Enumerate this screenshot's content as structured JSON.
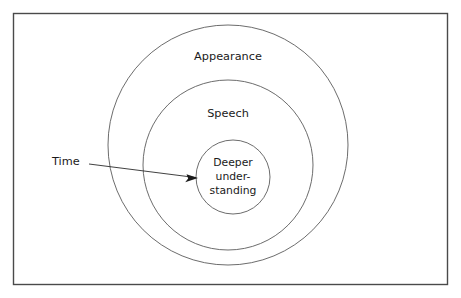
{
  "diagram": {
    "type": "concentric-circles",
    "title": "",
    "frame": {
      "border_color": "#4a4a4a",
      "background_color": "#ffffff"
    },
    "circle_stroke_color": "#5b5b5b",
    "rings": [
      {
        "id": "outer",
        "label": "Appearance",
        "cx": 228,
        "cy": 145,
        "r": 120,
        "label_x": 228,
        "label_y": 57
      },
      {
        "id": "middle",
        "label": "Speech",
        "cx": 228,
        "cy": 165,
        "r": 85,
        "label_x": 228,
        "label_y": 114
      },
      {
        "id": "inner",
        "label": "Deeper under- standing",
        "label_lines": [
          "Deeper",
          "under-",
          "standing"
        ],
        "cx": 233,
        "cy": 177,
        "r": 37,
        "label_x": 233,
        "label_y": 177
      }
    ],
    "annotation": {
      "label": "Time",
      "label_x": 52,
      "label_y": 162,
      "arrow": {
        "x1": 89,
        "y1": 164,
        "x2": 198,
        "y2": 178,
        "color": "#1a1a1a"
      }
    }
  }
}
